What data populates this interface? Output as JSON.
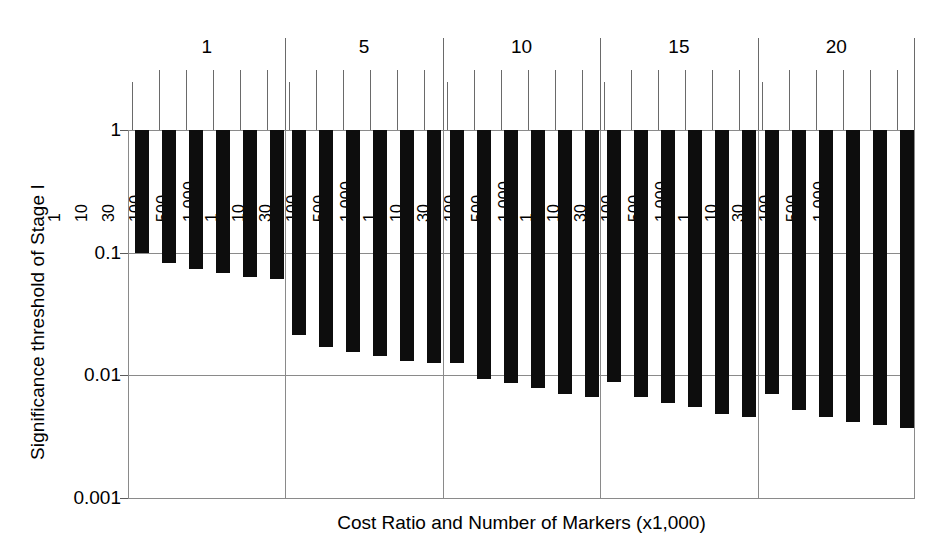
{
  "chart_data": {
    "type": "bar",
    "title": "",
    "xlabel": "Cost Ratio and Number of Markers (x1,000)",
    "ylabel": "Significance threshold of Stage I",
    "yscale": "log",
    "ylim": [
      0.001,
      1
    ],
    "ytick_labels": [
      "1",
      "0.1",
      "0.01",
      "0.001"
    ],
    "ytick_values": [
      1,
      0.1,
      0.01,
      0.001
    ],
    "grid": true,
    "legend": "none",
    "bar_baseline": 1,
    "bar_direction": "downward-from-1",
    "group_label_name": "Cost Ratio",
    "bar_label_name": "Number of Markers (x1,000)",
    "groups": [
      {
        "label": "1",
        "bars": [
          {
            "label": "1",
            "value": 0.1
          },
          {
            "label": "10",
            "value": 0.082
          },
          {
            "label": "30",
            "value": 0.073
          },
          {
            "label": "100",
            "value": 0.068
          },
          {
            "label": "500",
            "value": 0.063
          },
          {
            "label": "1,000",
            "value": 0.061
          }
        ]
      },
      {
        "label": "5",
        "bars": [
          {
            "label": "1",
            "value": 0.0215
          },
          {
            "label": "10",
            "value": 0.017
          },
          {
            "label": "30",
            "value": 0.0155
          },
          {
            "label": "100",
            "value": 0.0145
          },
          {
            "label": "500",
            "value": 0.013
          },
          {
            "label": "1,000",
            "value": 0.0125
          }
        ]
      },
      {
        "label": "10",
        "bars": [
          {
            "label": "1",
            "value": 0.0125
          },
          {
            "label": "10",
            "value": 0.0093
          },
          {
            "label": "30",
            "value": 0.0086
          },
          {
            "label": "100",
            "value": 0.0079
          },
          {
            "label": "500",
            "value": 0.007
          },
          {
            "label": "1,000",
            "value": 0.0067
          }
        ]
      },
      {
        "label": "15",
        "bars": [
          {
            "label": "1",
            "value": 0.0089
          },
          {
            "label": "10",
            "value": 0.0066
          },
          {
            "label": "30",
            "value": 0.006
          },
          {
            "label": "100",
            "value": 0.0055
          },
          {
            "label": "500",
            "value": 0.0048
          },
          {
            "label": "1,000",
            "value": 0.0046
          }
        ]
      },
      {
        "label": "20",
        "bars": [
          {
            "label": "1",
            "value": 0.007
          },
          {
            "label": "10",
            "value": 0.0052
          },
          {
            "label": "30",
            "value": 0.0046
          },
          {
            "label": "100",
            "value": 0.0042
          },
          {
            "label": "500",
            "value": 0.0039
          },
          {
            "label": "1,000",
            "value": 0.0037
          }
        ]
      }
    ],
    "colors": {
      "bar": "#0d0d0d",
      "grid": "#8a8a8a",
      "text": "#000000",
      "background": "#ffffff"
    }
  }
}
